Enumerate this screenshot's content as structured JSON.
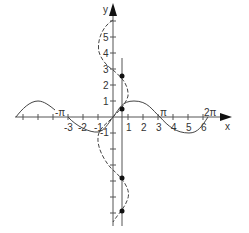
{
  "diagram": {
    "title": "",
    "axes": {
      "x_label": "x",
      "y_label": "y",
      "x_ticks": [
        "-3",
        "-2",
        "-1",
        "1",
        "2",
        "3",
        "4",
        "5",
        "6"
      ],
      "y_ticks_positive": [
        "1",
        "2",
        "3",
        "4",
        "5"
      ],
      "y_ticks_negative": [
        "-1"
      ],
      "special_labels": {
        "neg_pi": "-π",
        "pi": "π",
        "two_pi": "2π"
      }
    },
    "curves": [
      {
        "name": "sine-curve",
        "style": "solid",
        "description": "y = sin x"
      },
      {
        "name": "arcsine-multivalued-curve",
        "style": "dashed",
        "description": "x = sin y"
      },
      {
        "name": "vertical-line-x-0.5",
        "style": "solid"
      }
    ],
    "points": [
      {
        "name": "intersection-1",
        "x": 0.5,
        "y": 0.52
      },
      {
        "name": "intersection-2",
        "x": 0.5,
        "y": 2.62
      },
      {
        "name": "intersection-3",
        "x": 0.5,
        "y": -3.67
      },
      {
        "name": "intersection-4",
        "x": 0.5,
        "y": -5.76
      }
    ]
  }
}
